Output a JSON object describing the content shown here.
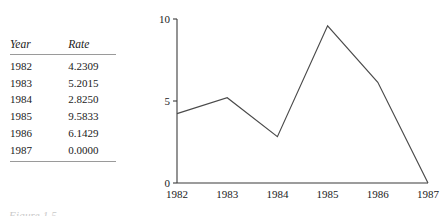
{
  "table": {
    "columns": [
      "Year",
      "Rate"
    ],
    "rows": [
      {
        "year": "1982",
        "rate": "4.2309"
      },
      {
        "year": "1983",
        "rate": "5.2015"
      },
      {
        "year": "1984",
        "rate": "2.8250"
      },
      {
        "year": "1985",
        "rate": "9.5833"
      },
      {
        "year": "1986",
        "rate": "6.1429"
      },
      {
        "year": "1987",
        "rate": "0.0000"
      }
    ]
  },
  "caption": "Figure 1.5",
  "chart_data": {
    "type": "line",
    "title": "",
    "xlabel": "",
    "ylabel": "",
    "categories": [
      "1982",
      "1983",
      "1984",
      "1985",
      "1986",
      "1987"
    ],
    "values": [
      4.2309,
      5.2015,
      2.825,
      9.5833,
      6.1429,
      0.0
    ],
    "series": [
      {
        "name": "Rate",
        "values": [
          4.2309,
          5.2015,
          2.825,
          9.5833,
          6.1429,
          0.0
        ]
      }
    ],
    "x_tick_labels": [
      "1982",
      "1983",
      "1984",
      "1985",
      "1986",
      "1987"
    ],
    "y_tick_labels": [
      "0",
      "5",
      "10"
    ],
    "y_ticks": [
      0,
      5,
      10
    ],
    "ylim": [
      0,
      10
    ],
    "grid": false,
    "legend": false,
    "line_color": "#4a4a4a",
    "axis_color": "#3b3b3b"
  }
}
